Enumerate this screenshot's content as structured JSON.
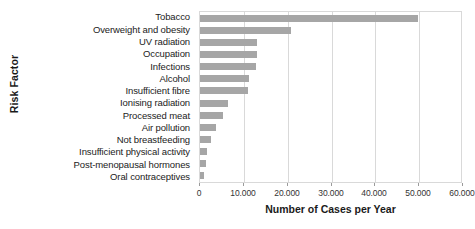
{
  "chart_data": {
    "type": "bar",
    "orientation": "horizontal",
    "title": "",
    "xlabel": "Number of Cases per Year",
    "ylabel": "Risk Factor",
    "categories": [
      "Tobacco",
      "Overweight and obesity",
      "UV radiation",
      "Occupation",
      "Infections",
      "Alcohol",
      "Insufficient fibre",
      "Ionising radiation",
      "Processed meat",
      "Air pollution",
      "Not breastfeeding",
      "Insufficient physical activity",
      "Post-menopausal hormones",
      "Oral contraceptives"
    ],
    "values": [
      49800,
      20800,
      13000,
      13000,
      12800,
      11200,
      11000,
      6400,
      5300,
      3700,
      2500,
      1700,
      1300,
      900
    ],
    "xlim": [
      0,
      60000
    ],
    "xticks": [
      0,
      10000,
      20000,
      30000,
      40000,
      50000,
      60000
    ],
    "xtick_labels": [
      "0",
      "10.000",
      "20.000",
      "30.000",
      "40.000",
      "50.000",
      "60.000"
    ],
    "grid": "vertical",
    "legend": null,
    "bar_color": "#a6a6a6",
    "grid_color": "#d9d9d9",
    "background_color": "#ffffff"
  }
}
